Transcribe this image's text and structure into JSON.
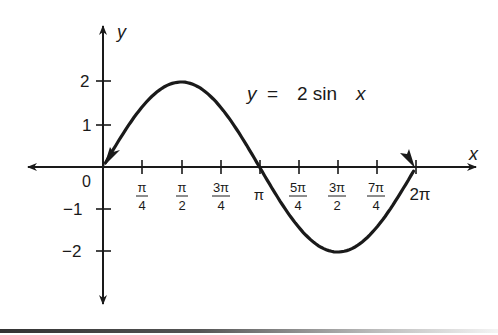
{
  "chart_data": {
    "type": "line",
    "title": "",
    "annotation": "y = 2 sin x",
    "xlabel": "x",
    "ylabel": "y",
    "function": "y = 2 sin x",
    "x_tick_labels": [
      "π/4",
      "π/2",
      "3π/4",
      "π",
      "5π/4",
      "3π/2",
      "7π/4",
      "2π"
    ],
    "x_ticks_radians": [
      0.7854,
      1.5708,
      2.3562,
      3.1416,
      3.927,
      4.7124,
      5.4978,
      6.2832
    ],
    "y_tick_labels": [
      "2",
      "1",
      "-1",
      "-2"
    ],
    "y_ticks": [
      2,
      1,
      -1,
      -2
    ],
    "origin_label": "0",
    "xlim": [
      0,
      6.2832
    ],
    "ylim": [
      -2,
      2
    ],
    "grid": false,
    "legend": null,
    "series": [
      {
        "name": "y = 2 sin x",
        "x": [
          0,
          0.7854,
          1.5708,
          2.3562,
          3.1416,
          3.927,
          4.7124,
          5.4978,
          6.2832
        ],
        "values": [
          0,
          1.414,
          2,
          1.414,
          0,
          -1.414,
          -2,
          -1.414,
          0
        ]
      }
    ]
  },
  "labels": {
    "y_axis": "y",
    "x_axis": "x",
    "origin": "0",
    "equation_y": "y",
    "equation_eq": "=",
    "equation_rhs": "2 sin",
    "equation_x": "x",
    "y_ticks": [
      "2",
      "1",
      "−1",
      "−2"
    ],
    "x_ticks": [
      {
        "num": "π",
        "den": "4"
      },
      {
        "num": "π",
        "den": "2"
      },
      {
        "num": "3π",
        "den": "4"
      },
      {
        "single": "π"
      },
      {
        "num": "5π",
        "den": "4"
      },
      {
        "num": "3π",
        "den": "2"
      },
      {
        "num": "7π",
        "den": "4"
      },
      {
        "single": "2π"
      }
    ]
  }
}
